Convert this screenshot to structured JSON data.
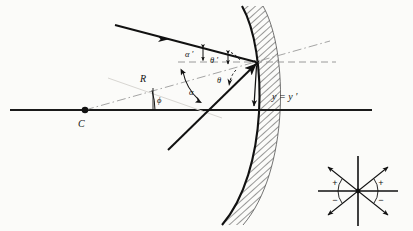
{
  "figure": {
    "title_visible": false,
    "type": "optics-ray-diagram",
    "colors": {
      "ink": "#111111",
      "axis": "#1a1a1a",
      "construction": "#8a8a8a",
      "hatch": "#3a3a3a",
      "background": "#fbfbf9"
    }
  },
  "labels": {
    "center_of_curvature": "C",
    "radius": "R",
    "phi": "ϕ",
    "alpha": "α",
    "alpha_prime": "α ′",
    "theta": "θ",
    "theta_prime": "θ ′",
    "height": "y = y ′"
  },
  "sign_inset": {
    "name": "sign-convention-key",
    "quadrant_upper_left": "+",
    "quadrant_upper_right": "+",
    "quadrant_lower_left": "−",
    "quadrant_lower_right": "−",
    "arrow_count": 4
  },
  "geometry": {
    "optical_axis_y": 110,
    "axis_x_start": 10,
    "axis_x_end": 372,
    "center_of_curvature_point": [
      85,
      110
    ],
    "vertex_point": [
      255,
      62
    ],
    "mirror_top": [
      242,
      6
    ],
    "mirror_bottom": [
      222,
      225
    ],
    "incident_ray_start": [
      115,
      25
    ],
    "reflected_ray_end": [
      168,
      150
    ],
    "radius_line_far": [
      330,
      41
    ],
    "dashed_horizontal_end": [
      336,
      62
    ]
  }
}
